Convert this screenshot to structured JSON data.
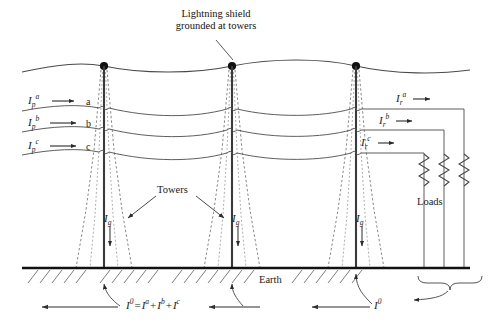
{
  "figure": {
    "type": "electrical-one-line-diagram",
    "colors": {
      "ink": "#1a1a1a",
      "conductor": "#555555",
      "tower_dashed": "#777777",
      "earth": "#111111",
      "background": "#ffffff"
    }
  },
  "annotations": {
    "lightning_shield": {
      "line1": "Lightning shield",
      "line2": "grounded at towers"
    },
    "towers_label": "Towers",
    "earth_label": "Earth",
    "loads_label": "Loads"
  },
  "sending_currents": [
    {
      "symbol": "I",
      "sub": "p",
      "sup": "a",
      "phase": "a"
    },
    {
      "symbol": "I",
      "sub": "p",
      "sup": "b",
      "phase": "b"
    },
    {
      "symbol": "I",
      "sub": "p",
      "sup": "c",
      "phase": "c"
    }
  ],
  "receiving_currents": [
    {
      "symbol": "I",
      "sub": "r",
      "sup": "a"
    },
    {
      "symbol": "I",
      "sub": "r",
      "sup": "b"
    },
    {
      "symbol": "I",
      "sub": "r",
      "sup": "c"
    }
  ],
  "phase_labels": [
    "a",
    "b",
    "c"
  ],
  "ground_currents": [
    {
      "symbol": "I",
      "sub": "g",
      "tower": 1
    },
    {
      "symbol": "I",
      "sub": "g",
      "tower": 2
    },
    {
      "symbol": "I",
      "sub": "g",
      "tower": 3
    }
  ],
  "equation": {
    "lhs": "I",
    "lhs_sup": "0",
    "equals": "=",
    "terms": [
      {
        "symbol": "I",
        "sup": "a"
      },
      {
        "symbol": "I",
        "sup": "b"
      },
      {
        "symbol": "I",
        "sup": "c"
      }
    ],
    "plus": "+",
    "full_text": "I0 = Ia + Ib + Ic"
  },
  "zero_sequence": {
    "symbol": "I",
    "sup": "0"
  },
  "geometry": {
    "towers_x": [
      104,
      232,
      356
    ],
    "shield_y": 66,
    "conductor_y": [
      108,
      128,
      150
    ],
    "earth_y": 268,
    "load_x": [
      424,
      444,
      464
    ],
    "width": 488,
    "height": 327
  }
}
